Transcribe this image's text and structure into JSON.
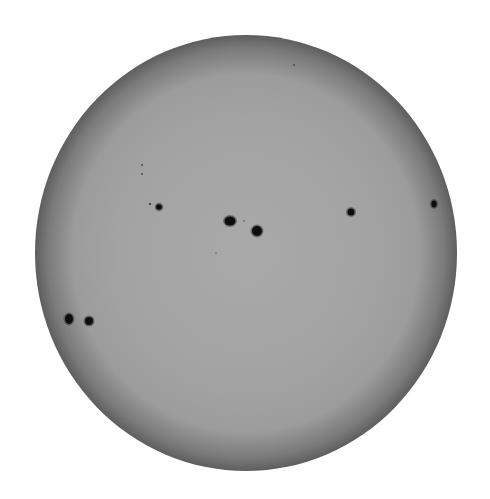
{
  "image": {
    "subject": "Full solar disk with sunspots",
    "background": "#ffffff",
    "disk": {
      "cx": 246,
      "cy": 253,
      "rx": 211,
      "ry": 218,
      "center_color": "#a9a9a9",
      "mid_color": "#9c9c9c",
      "limb_color": "#5e5e5e"
    },
    "sunspots": [
      {
        "id": "group-center-a",
        "cx": 230,
        "cy": 221,
        "rx": 5.5,
        "ry": 4.5
      },
      {
        "id": "group-center-b",
        "cx": 257,
        "cy": 231,
        "rx": 5,
        "ry": 5
      },
      {
        "id": "group-left-a",
        "cx": 69,
        "cy": 319,
        "rx": 4,
        "ry": 5
      },
      {
        "id": "group-left-b",
        "cx": 89,
        "cy": 321,
        "rx": 4,
        "ry": 4
      },
      {
        "id": "spot-upper-left",
        "cx": 159,
        "cy": 207,
        "rx": 2.8,
        "ry": 2.8
      },
      {
        "id": "spot-right",
        "cx": 351,
        "cy": 212,
        "rx": 3.5,
        "ry": 3.5
      },
      {
        "id": "spot-far-right",
        "cx": 434,
        "cy": 204,
        "rx": 2.6,
        "ry": 3.4
      }
    ],
    "pores": [
      {
        "cx": 142,
        "cy": 165,
        "r": 1
      },
      {
        "cx": 142,
        "cy": 174,
        "r": 1
      },
      {
        "cx": 150,
        "cy": 204,
        "r": 1.2
      },
      {
        "cx": 244,
        "cy": 221,
        "r": 0.8
      },
      {
        "cx": 294,
        "cy": 65,
        "r": 1
      },
      {
        "cx": 216,
        "cy": 253,
        "r": 0.7
      }
    ],
    "spot_color": "#0a0a0a"
  }
}
